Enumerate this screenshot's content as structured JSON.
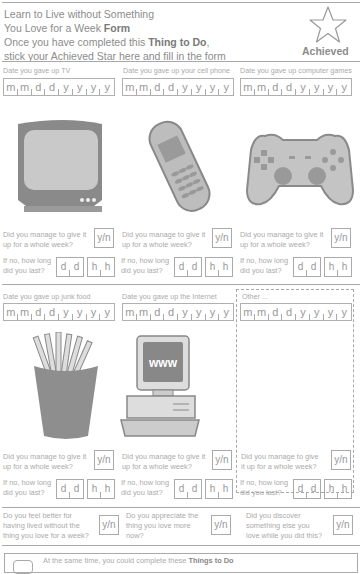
{
  "header": {
    "line1": "Learn to Live without Something",
    "line2_prefix": "You Love for a Week ",
    "line2_bold": "Form",
    "line3_prefix": "Once you have completed this ",
    "line3_bold": "Thing to Do",
    "line3_suffix": ",",
    "line4": "stick your Achieved Star here and fill in the form",
    "achieved_label": "Achieved"
  },
  "date_fields": [
    "m",
    "m",
    "d",
    "d",
    "y",
    "y",
    "y",
    "y"
  ],
  "sections": [
    {
      "label": "Date you gave up TV",
      "icon": "tv-icon"
    },
    {
      "label": "Date you gave up your cell phone",
      "icon": "cell-phone-icon"
    },
    {
      "label": "Date you gave up computer games",
      "icon": "game-controller-icon"
    },
    {
      "label": "Date you gave up junk food",
      "icon": "fries-icon"
    },
    {
      "label": "Date you gave up the Internet",
      "icon": "computer-www-icon"
    },
    {
      "label": "Other ...",
      "icon": ""
    }
  ],
  "questions": {
    "week_line1": "Did you manage to give it",
    "week_line2": "up for a whole week?",
    "week_other_line1": "Did you manage to give",
    "week_other_line2": "it up for a whole week?",
    "yn": "y/n",
    "howlong_line1": "If no, how long",
    "howlong_line2": "did you last?",
    "dd": [
      "d",
      "d"
    ],
    "hh": [
      "h",
      "h"
    ]
  },
  "final_questions": [
    {
      "l1": "Do you feel better for",
      "l2": "having lived without the",
      "l3": "thing you love for a week?"
    },
    {
      "l1": "Do you appreciate the",
      "l2": "thing you love more",
      "l3": "now?"
    },
    {
      "l1": "Did you discover",
      "l2": "something else you",
      "l3": "love while you did this?"
    }
  ],
  "footer": {
    "prefix": "At the same time, you could complete these ",
    "bold": "Things to Do"
  },
  "www_text": "www"
}
